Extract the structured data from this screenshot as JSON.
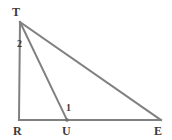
{
  "figure": {
    "background_color": "#ffffff",
    "stroke_color": "#808080",
    "label_color": "#3a3a3a",
    "stroke_width": 2,
    "width": 172,
    "height": 140,
    "vertices": [
      {
        "name": "T",
        "label": "T",
        "x": 20,
        "y": 22,
        "label_x": 12,
        "label_y": 6
      },
      {
        "name": "R",
        "label": "R",
        "x": 19,
        "y": 120,
        "label_x": 13,
        "label_y": 125
      },
      {
        "name": "U",
        "label": "U",
        "x": 67,
        "y": 120,
        "label_x": 62,
        "label_y": 125
      },
      {
        "name": "E",
        "label": "E",
        "x": 161,
        "y": 120,
        "label_x": 154,
        "label_y": 125
      }
    ],
    "segments": [
      {
        "name": "segment-TR",
        "from": "T",
        "to": "R",
        "x1": 20,
        "y1": 22,
        "x2": 19,
        "y2": 120
      },
      {
        "name": "segment-RE",
        "from": "R",
        "to": "E",
        "x1": 19,
        "y1": 120,
        "x2": 161,
        "y2": 120
      },
      {
        "name": "segment-TE",
        "from": "T",
        "to": "E",
        "x1": 20,
        "y1": 22,
        "x2": 161,
        "y2": 120
      },
      {
        "name": "segment-TU",
        "from": "T",
        "to": "U",
        "x1": 20,
        "y1": 22,
        "x2": 67,
        "y2": 120
      }
    ],
    "points": [
      {
        "name": "point-U-marker",
        "x": 67,
        "y": 120,
        "r": 1.8
      }
    ],
    "angle_labels": [
      {
        "name": "angle-2-at-T",
        "label": "2",
        "at_vertex": "T",
        "between": "TR and TU",
        "x": 17,
        "y": 39
      },
      {
        "name": "angle-1-at-U",
        "label": "1",
        "at_vertex": "U",
        "between": "UT and UE",
        "x": 66,
        "y": 103
      }
    ]
  }
}
